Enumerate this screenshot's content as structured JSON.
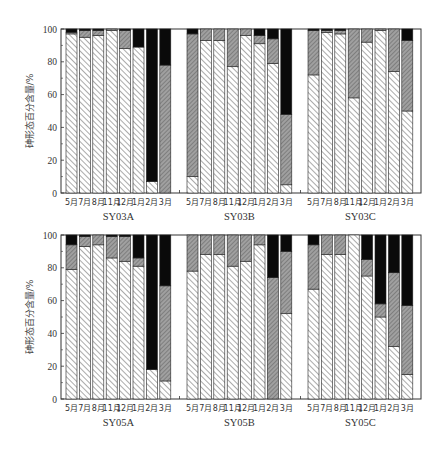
{
  "chart_data": [
    {
      "type": "bar",
      "stacked": true,
      "panel": "top",
      "ylabel": "砷形态百分含量/%",
      "ylim": [
        0,
        100
      ],
      "yticks": [
        0,
        20,
        40,
        60,
        80,
        100
      ],
      "grid": false,
      "legend": null,
      "categories": [
        "5月",
        "7月",
        "8月",
        "11月",
        "12月",
        "1月",
        "2月",
        "3月"
      ],
      "series_names": [
        "white-hatch (bottom)",
        "gray-hatch (middle)",
        "black (top)"
      ],
      "groups": [
        {
          "name": "SY03A",
          "series": [
            {
              "name": "white-hatch",
              "values": [
                97,
                95,
                96,
                99,
                88,
                89,
                7,
                0
              ]
            },
            {
              "name": "gray-hatch",
              "values": [
                1,
                4,
                3,
                1,
                11,
                0,
                0,
                78
              ]
            },
            {
              "name": "black",
              "values": [
                2,
                1,
                1,
                0,
                1,
                11,
                93,
                22
              ]
            }
          ]
        },
        {
          "name": "SY03B",
          "series": [
            {
              "name": "white-hatch",
              "values": [
                10,
                93,
                93,
                77,
                96,
                91,
                79,
                5
              ]
            },
            {
              "name": "gray-hatch",
              "values": [
                87,
                7,
                7,
                23,
                4,
                5,
                15,
                43
              ]
            },
            {
              "name": "black",
              "values": [
                3,
                0,
                0,
                0,
                0,
                4,
                6,
                52
              ]
            }
          ]
        },
        {
          "name": "SY03C",
          "series": [
            {
              "name": "white-hatch",
              "values": [
                72,
                98,
                97,
                58,
                92,
                99,
                74,
                50
              ]
            },
            {
              "name": "gray-hatch",
              "values": [
                27,
                1,
                2,
                42,
                8,
                1,
                26,
                43
              ]
            },
            {
              "name": "black",
              "values": [
                1,
                1,
                1,
                0,
                0,
                0,
                0,
                7
              ]
            }
          ]
        }
      ]
    },
    {
      "type": "bar",
      "stacked": true,
      "panel": "bottom",
      "ylabel": "砷形态百分含量/%",
      "ylim": [
        0,
        100
      ],
      "yticks": [
        0,
        20,
        40,
        60,
        80,
        100
      ],
      "grid": false,
      "legend": null,
      "categories": [
        "5月",
        "7月",
        "8月",
        "11月",
        "12月",
        "1月",
        "2月",
        "3月"
      ],
      "series_names": [
        "white-hatch (bottom)",
        "gray-hatch (middle)",
        "black (top)"
      ],
      "groups": [
        {
          "name": "SY05A",
          "series": [
            {
              "name": "white-hatch",
              "values": [
                79,
                93,
                94,
                86,
                84,
                81,
                18,
                11
              ]
            },
            {
              "name": "gray-hatch",
              "values": [
                15,
                6,
                6,
                13,
                15,
                5,
                0,
                58
              ]
            },
            {
              "name": "black",
              "values": [
                6,
                1,
                0,
                1,
                1,
                14,
                82,
                31
              ]
            }
          ]
        },
        {
          "name": "SY05B",
          "series": [
            {
              "name": "white-hatch",
              "values": [
                78,
                88,
                88,
                81,
                84,
                94,
                0,
                52
              ]
            },
            {
              "name": "gray-hatch",
              "values": [
                22,
                12,
                12,
                19,
                16,
                6,
                74,
                38
              ]
            },
            {
              "name": "black",
              "values": [
                0,
                0,
                0,
                0,
                0,
                0,
                26,
                10
              ]
            }
          ]
        },
        {
          "name": "SY05C",
          "series": [
            {
              "name": "white-hatch",
              "values": [
                67,
                88,
                88,
                100,
                75,
                50,
                32,
                15
              ]
            },
            {
              "name": "gray-hatch",
              "values": [
                27,
                12,
                12,
                0,
                10,
                8,
                45,
                42
              ]
            },
            {
              "name": "black",
              "values": [
                6,
                0,
                0,
                0,
                15,
                42,
                23,
                43
              ]
            }
          ]
        }
      ]
    }
  ],
  "colors": {
    "frame": "#333333",
    "white_hatch_bg": "#ffffff",
    "white_hatch_line": "#444444",
    "gray_hatch_bg": "#9a9a9a",
    "gray_hatch_line": "#555555",
    "black": "#0a0a0a"
  }
}
